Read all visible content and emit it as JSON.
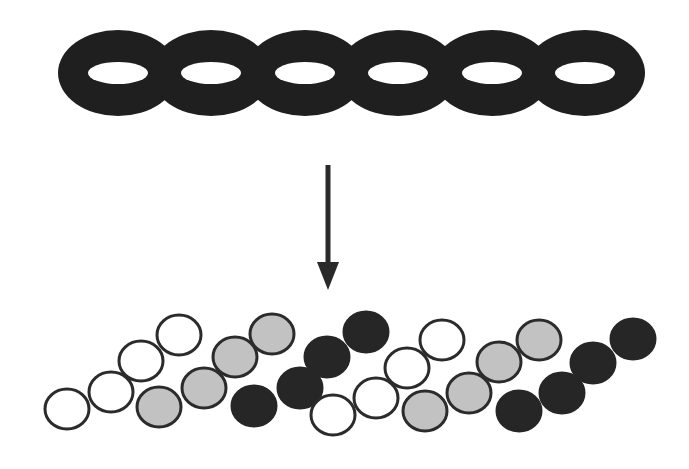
{
  "diagram": {
    "colors": {
      "background": "#ffffff",
      "torus": "#1f1f1f",
      "arrow": "#2a2a2a",
      "disc_outline": "#2b2b2b",
      "disc_white": "#ffffff",
      "disc_gray": "#c2c2c2",
      "disc_dark": "#262626"
    },
    "torus_chain": {
      "count": 6,
      "centers_x": [
        118,
        211,
        305,
        398,
        492,
        585
      ],
      "center_y": 73,
      "outer_rx": 60,
      "outer_ry": 43,
      "hole_rx": 30,
      "hole_ry": 11
    },
    "arrow": {
      "x": 328,
      "y1": 165,
      "y2": 290,
      "direction": "down"
    },
    "discs": [
      {
        "type": "white",
        "cx": 67,
        "cy": 409
      },
      {
        "type": "white",
        "cx": 111,
        "cy": 392
      },
      {
        "type": "white",
        "cx": 141,
        "cy": 361
      },
      {
        "type": "white",
        "cx": 179,
        "cy": 335
      },
      {
        "type": "gray",
        "cx": 159,
        "cy": 407
      },
      {
        "type": "gray",
        "cx": 204,
        "cy": 388
      },
      {
        "type": "gray",
        "cx": 235,
        "cy": 357
      },
      {
        "type": "gray",
        "cx": 272,
        "cy": 334
      },
      {
        "type": "dark",
        "cx": 254,
        "cy": 406
      },
      {
        "type": "dark",
        "cx": 300,
        "cy": 388
      },
      {
        "type": "dark",
        "cx": 327,
        "cy": 357
      },
      {
        "type": "dark",
        "cx": 366,
        "cy": 332
      },
      {
        "type": "white",
        "cx": 333,
        "cy": 415
      },
      {
        "type": "white",
        "cx": 376,
        "cy": 398
      },
      {
        "type": "white",
        "cx": 407,
        "cy": 368
      },
      {
        "type": "white",
        "cx": 442,
        "cy": 340
      },
      {
        "type": "gray",
        "cx": 425,
        "cy": 411
      },
      {
        "type": "gray",
        "cx": 469,
        "cy": 393
      },
      {
        "type": "gray",
        "cx": 499,
        "cy": 362
      },
      {
        "type": "gray",
        "cx": 539,
        "cy": 340
      },
      {
        "type": "dark",
        "cx": 519,
        "cy": 411
      },
      {
        "type": "dark",
        "cx": 562,
        "cy": 393
      },
      {
        "type": "dark",
        "cx": 593,
        "cy": 363
      },
      {
        "type": "dark",
        "cx": 633,
        "cy": 339
      }
    ],
    "disc_rx": 22,
    "disc_ry": 20
  }
}
